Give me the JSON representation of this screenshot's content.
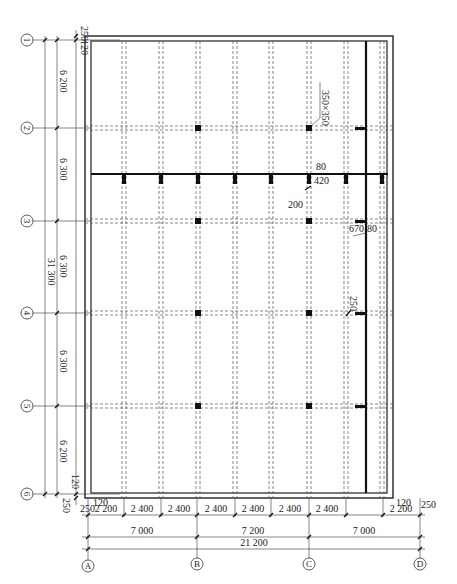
{
  "drawing": {
    "type": "structural-floor-plan",
    "row_axes": [
      {
        "label": "1",
        "y": 40
      },
      {
        "label": "2",
        "y": 128
      },
      {
        "label": "3",
        "y": 221
      },
      {
        "label": "4",
        "y": 313
      },
      {
        "label": "5",
        "y": 406
      },
      {
        "label": "6",
        "y": 494
      }
    ],
    "column_axes": [
      {
        "label": "A",
        "x": 88
      },
      {
        "label": "B",
        "x": 197
      },
      {
        "label": "C",
        "x": 309
      },
      {
        "label": "D",
        "x": 420
      }
    ],
    "left_dimensions": {
      "top_offsets": [
        "250",
        "120"
      ],
      "bays": [
        "6 200",
        "6 300",
        "6 300",
        "6 300",
        "6 200"
      ],
      "total": "31 300",
      "bottom_offsets": [
        "120",
        "250"
      ]
    },
    "bottom_dimensions": {
      "left_offsets": [
        "250",
        "120"
      ],
      "bays": [
        "2 200",
        "2 400",
        "2 400",
        "2 400",
        "2 400",
        "2 400",
        "2 400",
        "2 200"
      ],
      "right_offsets": [
        "120",
        "250"
      ],
      "spans": [
        "7 000",
        "7 200",
        "7 000"
      ],
      "total": "21 200"
    },
    "annotations": {
      "column_size": "350×350",
      "beam_80": "80",
      "beam_420": "420",
      "offset_200": "200",
      "offset_670": "670",
      "offset_80b": "80",
      "offset_250": "250"
    }
  }
}
